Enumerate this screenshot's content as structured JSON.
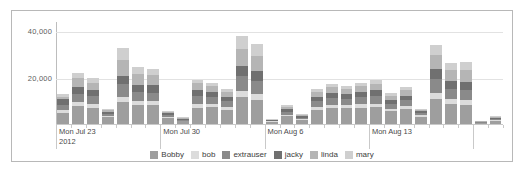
{
  "chart_data": {
    "type": "bar",
    "stacked": true,
    "title": "",
    "xlabel": "",
    "ylabel": "",
    "ylim": [
      0,
      44000
    ],
    "grid": true,
    "legend_position": "bottom",
    "y_ticks": [
      "20,000",
      "40,000"
    ],
    "y_tick_values": [
      20000,
      40000
    ],
    "x_tick_labels": [
      {
        "line1": "Mon Jul 23",
        "line2": "2012"
      },
      {
        "line1": "Mon Jul 30",
        "line2": ""
      },
      {
        "line1": "Mon Aug 6",
        "line2": ""
      },
      {
        "line1": "Mon Aug 13",
        "line2": ""
      }
    ],
    "series": [
      {
        "name": "Bobby",
        "color": "#9e9e9e"
      },
      {
        "name": "bob",
        "color": "#dcdcdc"
      },
      {
        "name": "extrauser",
        "color": "#8a8a8a"
      },
      {
        "name": "jacky",
        "color": "#707070"
      },
      {
        "name": "linda",
        "color": "#b5b5b5"
      },
      {
        "name": "mary",
        "color": "#cfcfcf"
      }
    ],
    "categories": [
      "Mon Jul 23",
      "Tue Jul 24",
      "Wed Jul 25",
      "Thu Jul 26",
      "Fri Jul 27",
      "Sat Jul 28",
      "Sun Jul 29",
      "Mon Jul 30",
      "Tue Jul 31",
      "Wed Aug 1",
      "Thu Aug 2",
      "Fri Aug 3",
      "Sat Aug 4",
      "Sun Aug 5",
      "Mon Aug 6",
      "Tue Aug 7",
      "Wed Aug 8",
      "Thu Aug 9",
      "Fri Aug 10",
      "Sat Aug 11",
      "Sun Aug 12",
      "Mon Aug 13",
      "Tue Aug 14",
      "Wed Aug 15",
      "Thu Aug 16",
      "Fri Aug 17",
      "Sat Aug 18",
      "Sun Aug 19",
      "Mon Aug 20",
      "Tue Aug 21"
    ],
    "values": [
      [
        4600,
        1500,
        2000,
        2600,
        900,
        1400
      ],
      [
        7800,
        1700,
        3600,
        2900,
        3800,
        2200
      ],
      [
        7000,
        1500,
        3700,
        2300,
        3000,
        2300
      ],
      [
        2900,
        600,
        900,
        1000,
        500,
        500
      ],
      [
        9500,
        2200,
        5500,
        3600,
        6700,
        5200
      ],
      [
        8200,
        1700,
        4000,
        3100,
        4800,
        2600
      ],
      [
        8100,
        1700,
        3700,
        3200,
        4400,
        2600
      ],
      [
        2600,
        500,
        700,
        900,
        400,
        400
      ],
      [
        1200,
        300,
        400,
        400,
        300,
        300
      ],
      [
        7100,
        1500,
        3500,
        2600,
        2800,
        1700
      ],
      [
        7200,
        1300,
        3000,
        2200,
        2700,
        1500
      ],
      [
        6100,
        1200,
        2500,
        1900,
        2300,
        1200
      ],
      [
        11600,
        2600,
        6500,
        4300,
        7300,
        5600
      ],
      [
        10400,
        2400,
        5900,
        4000,
        6800,
        5200
      ],
      [
        900,
        200,
        300,
        300,
        200,
        200
      ],
      [
        3400,
        700,
        1100,
        1300,
        900,
        800
      ],
      [
        1700,
        400,
        600,
        700,
        400,
        400
      ],
      [
        6100,
        1200,
        2600,
        1900,
        2100,
        1300
      ],
      [
        7000,
        1300,
        2900,
        2200,
        2400,
        1500
      ],
      [
        6700,
        1300,
        2800,
        2100,
        2300,
        1400
      ],
      [
        7100,
        1400,
        3000,
        2300,
        2500,
        1500
      ],
      [
        7400,
        1400,
        3200,
        2500,
        2600,
        1700
      ],
      [
        5500,
        1000,
        2100,
        1700,
        1900,
        1100
      ],
      [
        6300,
        1300,
        2700,
        2000,
        2400,
        1400
      ],
      [
        3100,
        600,
        900,
        1000,
        600,
        500
      ],
      [
        10800,
        2400,
        6200,
        4200,
        6000,
        4400
      ],
      [
        8700,
        1900,
        4500,
        3300,
        4800,
        3200
      ],
      [
        8400,
        1900,
        4400,
        3300,
        5200,
        3600
      ],
      [
        500,
        150,
        200,
        200,
        150,
        150
      ],
      [
        1400,
        350,
        500,
        500,
        350,
        300
      ]
    ]
  }
}
